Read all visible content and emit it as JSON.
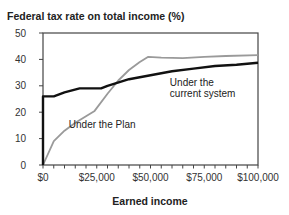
{
  "chart_data": {
    "type": "line",
    "title": "Federal tax rate on total income (%)",
    "xlabel": "Earned income",
    "ylabel": "",
    "xlim": [
      0,
      100000
    ],
    "ylim": [
      0,
      50
    ],
    "grid": false,
    "legend_position": "inline annotations",
    "x_ticks": [
      0,
      25000,
      50000,
      75000,
      100000
    ],
    "x_tick_labels": [
      "$0",
      "$25,000",
      "$50,000",
      "$75,000",
      "$100,000"
    ],
    "x_minor_tick_step": 5000,
    "y_ticks": [
      0,
      10,
      20,
      30,
      40,
      50
    ],
    "y_tick_labels": [
      "0",
      "10",
      "20",
      "30",
      "40",
      "50"
    ],
    "series": [
      {
        "name": "Under the current system",
        "color": "#111111",
        "points": [
          [
            0,
            0
          ],
          [
            0,
            26
          ],
          [
            5000,
            26
          ],
          [
            10000,
            27.5
          ],
          [
            17000,
            29
          ],
          [
            27000,
            29
          ],
          [
            30000,
            30
          ],
          [
            40000,
            32.5
          ],
          [
            50000,
            34
          ],
          [
            60000,
            35.5
          ],
          [
            70000,
            36.5
          ],
          [
            80000,
            37.5
          ],
          [
            90000,
            38
          ],
          [
            100000,
            38.7
          ]
        ]
      },
      {
        "name": "Under the Plan",
        "color": "#9a9a9a",
        "points": [
          [
            0,
            0
          ],
          [
            5000,
            9
          ],
          [
            10000,
            13
          ],
          [
            15000,
            16
          ],
          [
            20000,
            18.5
          ],
          [
            24000,
            20.5
          ],
          [
            30000,
            27
          ],
          [
            35000,
            32
          ],
          [
            40000,
            36
          ],
          [
            45000,
            39
          ],
          [
            49000,
            41
          ],
          [
            55000,
            40.7
          ],
          [
            65000,
            40.5
          ],
          [
            75000,
            41
          ],
          [
            85000,
            41.3
          ],
          [
            100000,
            41.6
          ]
        ]
      }
    ],
    "annotations": [
      {
        "text_lines": [
          "Under the",
          "current system"
        ],
        "x": 59000,
        "y": 30
      },
      {
        "text_lines": [
          "Under the Plan"
        ],
        "x": 12000,
        "y": 14
      }
    ]
  }
}
